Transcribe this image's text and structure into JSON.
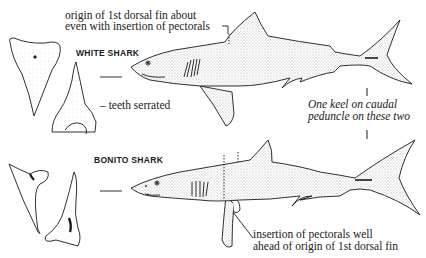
{
  "annotations": {
    "dorsal_origin_line1": "origin of 1st dorsal fin about",
    "dorsal_origin_line2": "even with insertion of pectorals",
    "teeth_serrated": "– teeth serrated",
    "keel_line1": "One keel on caudal",
    "keel_line2": "peduncle on these two",
    "pectoral_line1": "insertion of pectorals well",
    "pectoral_line2": "ahead of origin of 1st dorsal fin"
  },
  "species": {
    "white": {
      "name": "WHITE SHARK"
    },
    "bonito": {
      "name": "BONITO SHARK"
    }
  },
  "colors": {
    "ink": "#1a1a1a",
    "stipple": "#d9d9d9",
    "paper": "#ffffff"
  }
}
